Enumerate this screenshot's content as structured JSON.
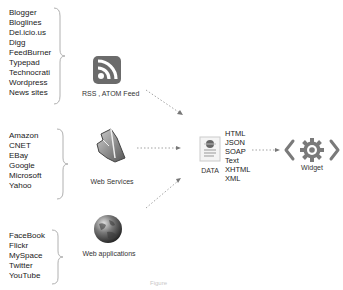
{
  "groups": [
    {
      "name": "feeds",
      "items": [
        "Blogger",
        "Bloglines",
        "Del.icio.us",
        "Digg",
        "FeedBurner",
        "Typepad",
        "Technocrati",
        "Wordpress",
        "News sites"
      ],
      "source_label": "RSS , ATOM Feed",
      "icon": "rss-icon"
    },
    {
      "name": "web-services",
      "items": [
        "Amazon",
        "CNET",
        "EBay",
        "Google",
        "Microsoft",
        "Yahoo"
      ],
      "source_label": "Web Services",
      "icon": "web-services-icon"
    },
    {
      "name": "web-apps",
      "items": [
        "FaceBook",
        "Flickr",
        "MySpace",
        "Twitter",
        "YouTube"
      ],
      "source_label": "Web applications",
      "icon": "globe-icon"
    }
  ],
  "data_node": {
    "label": "DATA",
    "icon": "document-icon",
    "formats": [
      "HTML",
      "JSON",
      "SOAP",
      "Text",
      "XHTML",
      "XML"
    ]
  },
  "widget_node": {
    "label": "Widget",
    "icon": "gear-code-icon"
  },
  "caption": "Figure",
  "colors": {
    "rss_icon": "#6b6b6b",
    "gear": "#7a7a7a",
    "arrow": "#999999",
    "brace": "#b0b0b0"
  }
}
